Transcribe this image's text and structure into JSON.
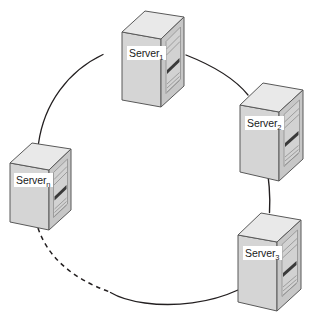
{
  "diagram": {
    "type": "ring-topology",
    "background_color": "#ffffff",
    "ring": {
      "shape": "circle",
      "center_x": 155,
      "center_y": 162,
      "radius": 117,
      "stroke_color": "#231f20",
      "stroke_width": 1.2,
      "dashed_segment_label": "ellipsis-link"
    },
    "icon_colors": {
      "left_face": "#d9d9d9",
      "front_face": "#c9c9c9",
      "top_face": "#e8e8e8",
      "outline": "#4d4d4d",
      "panel_line": "#8c8c8c",
      "slot_dark": "#3a3a3a"
    },
    "nodes": [
      {
        "id": "server-1",
        "label_prefix": "Server",
        "label_sub": "1",
        "position": "top"
      },
      {
        "id": "server-2",
        "label_prefix": "Server",
        "label_sub": "2",
        "position": "right"
      },
      {
        "id": "server-3",
        "label_prefix": "Server",
        "label_sub": "3",
        "position": "bottom-right"
      },
      {
        "id": "server-n",
        "label_prefix": "Server",
        "label_sub": "n",
        "position": "left"
      }
    ]
  }
}
